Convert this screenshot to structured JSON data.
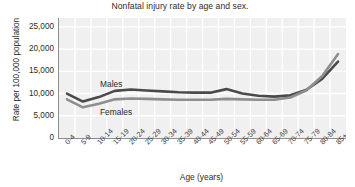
{
  "chart_data": {
    "type": "line",
    "title": "Nonfatal injury rate by age and sex.",
    "xlabel": "Age (years)",
    "ylabel": "Rate per 100,000 population",
    "categories": [
      "0-4",
      "5-9",
      "10-14",
      "15-19",
      "20-24",
      "25-29",
      "30-34",
      "35-39",
      "40-44",
      "45-49",
      "50-54",
      "55-59",
      "60-64",
      "65-69",
      "70-74",
      "75-79",
      "80-84",
      "85+"
    ],
    "ylim": [
      0,
      27000
    ],
    "yticks": [
      0,
      5000,
      10000,
      15000,
      20000,
      25000
    ],
    "ytick_labels": [
      "0",
      "5,000",
      "10,000",
      "15,000",
      "20,000",
      "25,000"
    ],
    "grid": true,
    "legend_position": "inline",
    "series": [
      {
        "name": "Males",
        "color": "#4a4a4a",
        "values": [
          10000,
          8200,
          9200,
          10600,
          10900,
          10700,
          10500,
          10300,
          10200,
          10200,
          11000,
          10000,
          9500,
          9300,
          9600,
          10800,
          13300,
          17200
        ]
      },
      {
        "name": "Females",
        "color": "#8e8e8e",
        "values": [
          8700,
          6900,
          7700,
          8700,
          8900,
          8800,
          8700,
          8600,
          8600,
          8600,
          8800,
          8700,
          8600,
          8600,
          9100,
          10700,
          13900,
          18900
        ]
      }
    ]
  },
  "labels": {
    "males": "Males",
    "females": "Females"
  }
}
